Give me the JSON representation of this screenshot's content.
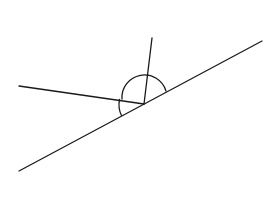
{
  "diagram": {
    "type": "geometry-angles",
    "colors": {
      "background": "#ffffff",
      "stroke": "#1a1a1a"
    },
    "vertex": {
      "x": 144,
      "y": 104
    },
    "lines": [
      {
        "name": "main-line",
        "x1": 19,
        "y1": 171,
        "x2": 262,
        "y2": 41
      },
      {
        "name": "left-ray",
        "x1": 19,
        "y1": 86,
        "x2": 144,
        "y2": 104
      },
      {
        "name": "upper-ray",
        "x1": 152,
        "y1": 38,
        "x2": 144,
        "y2": 104
      }
    ],
    "arcs": [
      {
        "name": "upper-angle-arc",
        "d": "M 122 99 A 22.5 22.5 0 0 1 166 91"
      },
      {
        "name": "lower-left-angle-arc",
        "d": "M 119.5 99.5 A 25 25 0 0 0 121.5 115.5"
      }
    ]
  }
}
